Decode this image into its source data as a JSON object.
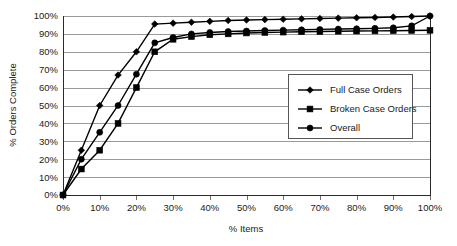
{
  "chart_data": {
    "type": "line",
    "title": "",
    "xlabel": "% Items",
    "ylabel": "% Orders Complete",
    "xlim": [
      0,
      100
    ],
    "ylim": [
      0,
      100
    ],
    "grid": "horizontal",
    "legend_position": "center-right",
    "x_tick_labels": [
      "0%",
      "10%",
      "20%",
      "30%",
      "40%",
      "50%",
      "60%",
      "70%",
      "80%",
      "90%",
      "100%"
    ],
    "y_tick_labels": [
      "0%",
      "10%",
      "20%",
      "30%",
      "40%",
      "50%",
      "60%",
      "70%",
      "80%",
      "90%",
      "100%"
    ],
    "x": [
      0,
      5,
      10,
      15,
      20,
      25,
      30,
      35,
      40,
      45,
      50,
      55,
      60,
      65,
      70,
      75,
      80,
      85,
      90,
      95,
      100
    ],
    "series": [
      {
        "name": "Full Case Orders",
        "marker": "diamond",
        "color": "#000000",
        "values": [
          0,
          25,
          50,
          67,
          80,
          95.5,
          96,
          96.5,
          97,
          97.5,
          97.8,
          98,
          98.2,
          98.4,
          98.6,
          98.8,
          99,
          99.2,
          99.4,
          99.7,
          100
        ]
      },
      {
        "name": "Broken Case Orders",
        "marker": "square",
        "color": "#000000",
        "values": [
          0,
          14.5,
          25,
          40,
          60,
          80,
          87,
          88.5,
          89.5,
          90,
          90.5,
          90.8,
          91,
          91.2,
          91.3,
          91.5,
          91.6,
          91.7,
          91.8,
          91.9,
          92
        ]
      },
      {
        "name": "Overall",
        "marker": "circle",
        "color": "#000000",
        "values": [
          0,
          20,
          35,
          50,
          67.5,
          85,
          88,
          90,
          90.8,
          91.3,
          91.6,
          91.9,
          92.1,
          92.3,
          92.5,
          92.7,
          92.9,
          93.1,
          93.4,
          94.5,
          100
        ]
      }
    ]
  },
  "legend": {
    "items": [
      {
        "label": "Full Case Orders",
        "marker": "diamond"
      },
      {
        "label": "Broken Case Orders",
        "marker": "square"
      },
      {
        "label": "Overall",
        "marker": "circle"
      }
    ]
  }
}
